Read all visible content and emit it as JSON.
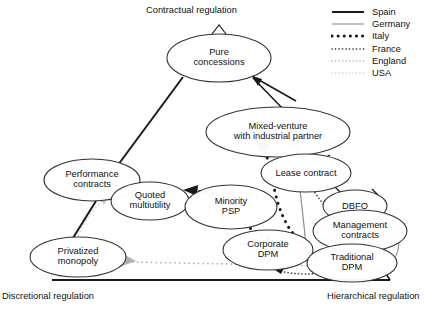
{
  "diagram": {
    "title_axes": {
      "top": "Contractual regulation",
      "bottom_left": "Discretional regulation",
      "bottom_right": "Hierarchical regulation"
    },
    "nodes": [
      {
        "id": "pure-concessions",
        "label_line1": "Pure",
        "label_line2": "concessions",
        "cx": 219,
        "cy": 58,
        "rx": 52,
        "ry": 24
      },
      {
        "id": "mixed-venture",
        "label_line1": "Mixed-venture",
        "label_line2": "with industrial partner",
        "cx": 278,
        "cy": 132,
        "rx": 72,
        "ry": 25
      },
      {
        "id": "performance-contracts",
        "label_line1": "Performance",
        "label_line2": "contracts",
        "cx": 92,
        "cy": 180,
        "rx": 48,
        "ry": 21
      },
      {
        "id": "lease-contract",
        "label_line1": "Lease contract",
        "label_line2": "",
        "cx": 306,
        "cy": 173,
        "rx": 45,
        "ry": 19
      },
      {
        "id": "quoted-multiutility",
        "label_line1": "Quoted",
        "label_line2": "multiutility",
        "cx": 150,
        "cy": 201,
        "rx": 39,
        "ry": 19
      },
      {
        "id": "minority-psp",
        "label_line1": "Minority",
        "label_line2": "PSP",
        "cx": 231,
        "cy": 207,
        "rx": 46,
        "ry": 22
      },
      {
        "id": "dbfo",
        "label_line1": "DBFO",
        "label_line2": "",
        "cx": 355,
        "cy": 206,
        "rx": 32,
        "ry": 16
      },
      {
        "id": "management-contracts",
        "label_line1": "Management",
        "label_line2": "contracts",
        "cx": 360,
        "cy": 231,
        "rx": 47,
        "ry": 21
      },
      {
        "id": "corporate-dpm",
        "label_line1": "Corporate",
        "label_line2": "DPM",
        "cx": 268,
        "cy": 250,
        "rx": 45,
        "ry": 20
      },
      {
        "id": "traditional-dpm",
        "label_line1": "Traditional",
        "label_line2": "DPM",
        "cx": 352,
        "cy": 263,
        "rx": 45,
        "ry": 19
      },
      {
        "id": "privatized-monopoly",
        "label_line1": "Privatized",
        "label_line2": "monopoly",
        "cx": 78,
        "cy": 257,
        "rx": 48,
        "ry": 20
      }
    ],
    "legend": {
      "items": [
        {
          "name": "Spain",
          "style": "solid",
          "color": "#1a1a1a",
          "width": 2.0
        },
        {
          "name": "Germany",
          "style": "solid",
          "color": "#8c8c8c",
          "width": 1.1
        },
        {
          "name": "Italy",
          "style": "dotted-thick",
          "color": "#1a1a1a",
          "width": 3.0
        },
        {
          "name": "France",
          "style": "dotted-fine",
          "color": "#1a1a1a",
          "width": 1.5
        },
        {
          "name": "England",
          "style": "dotted-fine",
          "color": "#b0b0b0",
          "width": 1.6
        },
        {
          "name": "USA",
          "style": "dotted-fine",
          "color": "#cccccc",
          "width": 1.4
        }
      ]
    },
    "colors": {
      "spain": "#1a1a1a",
      "germany": "#8c8c8c",
      "italy": "#1a1a1a",
      "france": "#1a1a1a",
      "england": "#b0b0b0",
      "usa": "#cccccc",
      "node_stroke": "#333333",
      "node_fill": "#ffffff"
    }
  }
}
